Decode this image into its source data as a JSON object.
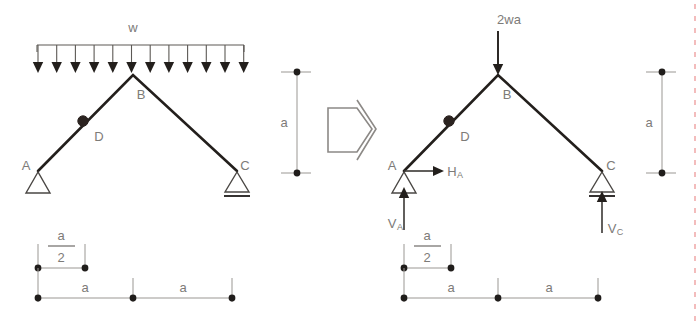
{
  "figure": {
    "background_color": "#ffffff",
    "member_color": "#231f1c",
    "label_color": "#7d7b78",
    "dimension_color": "#9a9793"
  },
  "left_diagram": {
    "name": "original-loading",
    "joints": [
      {
        "id": "A",
        "label": "A",
        "support": "pin"
      },
      {
        "id": "B",
        "label": "B",
        "support": "none"
      },
      {
        "id": "C",
        "label": "C",
        "support": "roller"
      },
      {
        "id": "D",
        "label": "D",
        "support": "internal-hinge"
      }
    ],
    "load": {
      "type": "uniformly-distributed",
      "label": "w",
      "arrow_count": 12,
      "direction": "down"
    },
    "vertical_dimension": {
      "label": "a"
    },
    "horizontal_dimensions": {
      "upper": {
        "numerator": "a",
        "denominator": "2"
      },
      "lower_left": "a",
      "lower_right": "a"
    }
  },
  "transform_symbol": {
    "name": "implies-arrow",
    "shape": "right-pointing-block-arrow"
  },
  "right_diagram": {
    "name": "equivalent-loading",
    "joints": [
      {
        "id": "A",
        "label": "A",
        "support": "pin"
      },
      {
        "id": "B",
        "label": "B",
        "support": "none"
      },
      {
        "id": "C",
        "label": "C",
        "support": "roller"
      },
      {
        "id": "D",
        "label": "D",
        "support": "internal-hinge"
      }
    ],
    "load": {
      "type": "point-load",
      "label": "2wa",
      "direction": "down",
      "applied_at": "B"
    },
    "reactions": [
      {
        "id": "HA",
        "base": "H",
        "sub": "A",
        "direction": "right",
        "at": "A"
      },
      {
        "id": "VA",
        "base": "V",
        "sub": "A",
        "direction": "up",
        "at": "A"
      },
      {
        "id": "VC",
        "base": "V",
        "sub": "C",
        "direction": "up",
        "at": "C"
      }
    ],
    "vertical_dimension": {
      "label": "a"
    },
    "horizontal_dimensions": {
      "upper": {
        "numerator": "a",
        "denominator": "2"
      },
      "lower_left": "a",
      "lower_right": "a"
    }
  }
}
